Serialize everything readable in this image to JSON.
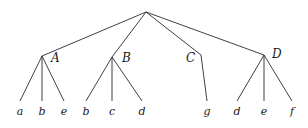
{
  "diagram": {
    "type": "tree",
    "root": {
      "x": 146,
      "y": 12
    },
    "internal_nodes": [
      {
        "id": "A",
        "label": "A",
        "x": 42,
        "y": 56,
        "label_x": 51,
        "label_y": 62,
        "leaves": [
          {
            "label": "a",
            "x": 20
          },
          {
            "label": "b",
            "x": 42
          },
          {
            "label": "e",
            "x": 64
          }
        ]
      },
      {
        "id": "B",
        "label": "B",
        "x": 112,
        "y": 57,
        "label_x": 122,
        "label_y": 62,
        "leaves": [
          {
            "label": "b",
            "x": 86
          },
          {
            "label": "c",
            "x": 112
          },
          {
            "label": "d",
            "x": 142
          }
        ]
      },
      {
        "id": "C",
        "label": "C",
        "x": 201,
        "y": 55,
        "label_x": 186,
        "label_y": 62,
        "leaves": [
          {
            "label": "g",
            "x": 207
          }
        ]
      },
      {
        "id": "D",
        "label": "D",
        "x": 264,
        "y": 55,
        "label_x": 272,
        "label_y": 58,
        "leaves": [
          {
            "label": "d",
            "x": 237
          },
          {
            "label": "e",
            "x": 264
          },
          {
            "label": "f",
            "x": 292
          }
        ]
      }
    ],
    "leaf_line_bottom_y": 101,
    "leaf_label_y": 115
  }
}
